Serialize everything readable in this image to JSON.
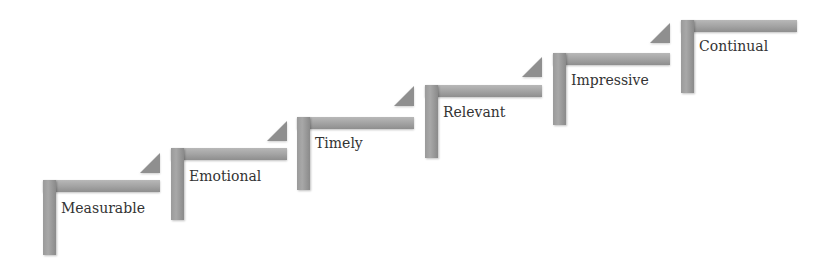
{
  "diagram": {
    "type": "staircase",
    "colors": {
      "step_fill": "#a4a4a4",
      "triangle_fill": "#8f8f8f",
      "text": "#333333",
      "background": "#ffffff"
    },
    "steps": [
      {
        "label": "Measurable",
        "x": 43,
        "y": 180,
        "width": 117,
        "height": 75
      },
      {
        "label": "Emotional",
        "x": 171,
        "y": 148,
        "width": 116,
        "height": 72
      },
      {
        "label": "Timely",
        "x": 297,
        "y": 117,
        "width": 117,
        "height": 73
      },
      {
        "label": "Relevant",
        "x": 425,
        "y": 85,
        "width": 117,
        "height": 73
      },
      {
        "label": "Impressive",
        "x": 553,
        "y": 53,
        "width": 117,
        "height": 72
      },
      {
        "label": "Continual",
        "x": 681,
        "y": 20,
        "width": 116,
        "height": 73
      }
    ],
    "triangles": [
      {
        "x": 140,
        "y": 153
      },
      {
        "x": 267,
        "y": 121
      },
      {
        "x": 394,
        "y": 86
      },
      {
        "x": 522,
        "y": 57
      },
      {
        "x": 650,
        "y": 23
      }
    ]
  }
}
